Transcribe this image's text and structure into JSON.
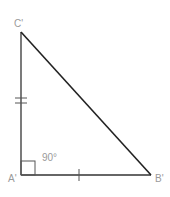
{
  "diagram": {
    "type": "right-triangle",
    "vertices": {
      "C": {
        "label": "C'",
        "x": 21,
        "y": 32
      },
      "A": {
        "label": "A'",
        "x": 21,
        "y": 175
      },
      "B": {
        "label": "B'",
        "x": 151,
        "y": 175
      }
    },
    "angle_label": "90°",
    "right_angle_vertex": "A'",
    "tick_marks": {
      "side_AC": 2,
      "side_AB": 1
    },
    "colors": {
      "line": "#222222",
      "label": "#9a9a9a",
      "background": "#ffffff"
    }
  }
}
